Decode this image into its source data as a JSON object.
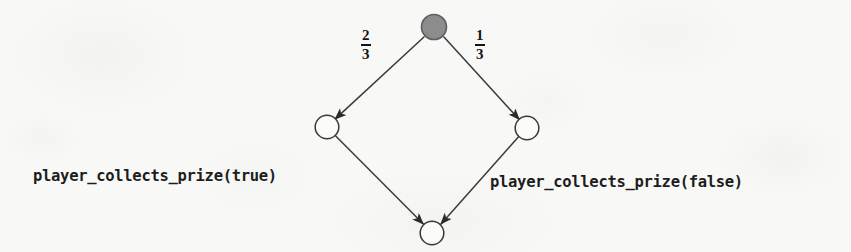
{
  "figure": {
    "type": "probabilistic-transition-diagram",
    "background_color": "#f8f8f7",
    "ink_color": "#2b2b2b",
    "root_fill_color": "#8c8c8c"
  },
  "nodes": [
    {
      "id": "root",
      "name": "root-node",
      "shape": "circle",
      "fill": "filled-gray",
      "cx": 434,
      "cy": 27,
      "r": 13
    },
    {
      "id": "left",
      "name": "left-node",
      "shape": "circle",
      "fill": "white",
      "cx": 327,
      "cy": 127,
      "r": 12
    },
    {
      "id": "right",
      "name": "right-node",
      "shape": "circle",
      "fill": "white",
      "cx": 527,
      "cy": 128,
      "r": 12
    },
    {
      "id": "bottom",
      "name": "bottom-node",
      "shape": "circle",
      "fill": "white",
      "cx": 432,
      "cy": 233,
      "r": 12
    }
  ],
  "edges": [
    {
      "id": "root-to-left",
      "from": "root",
      "to": "left",
      "probability_numerator": "2",
      "probability_denominator": "3",
      "label_x": 363,
      "label_y": 30
    },
    {
      "id": "root-to-right",
      "from": "root",
      "to": "right",
      "probability_numerator": "1",
      "probability_denominator": "3",
      "label_x": 477,
      "label_y": 30
    },
    {
      "id": "left-to-bottom",
      "from": "left",
      "to": "bottom",
      "probability_numerator": "",
      "probability_denominator": "",
      "label_x": 0,
      "label_y": 0
    },
    {
      "id": "right-to-bottom",
      "from": "right",
      "to": "bottom",
      "probability_numerator": "",
      "probability_denominator": "",
      "label_x": 0,
      "label_y": 0
    }
  ],
  "labels": {
    "left_branch": {
      "text": "player_collects_prize(true)",
      "x": 33,
      "y": 167
    },
    "right_branch": {
      "text": "player_collects_prize(false)",
      "x": 490,
      "y": 173
    }
  }
}
